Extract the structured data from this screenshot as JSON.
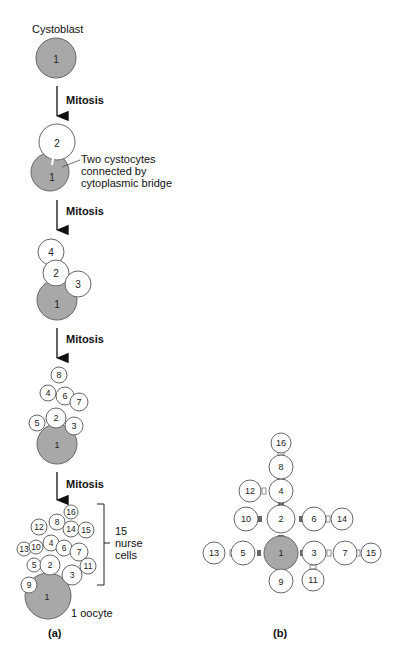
{
  "colors": {
    "oocyte_fill": "#a8a8a8",
    "nurse_fill": "#ffffff",
    "stroke": "#555555",
    "ring_canal_b": "#666666",
    "ring_canal_b_light": "#ffffff",
    "arrow": "#111111"
  },
  "panel_a": {
    "label": "(a)",
    "stage1": {
      "title": "Cystoblast",
      "cells": [
        "1"
      ]
    },
    "arrow1": {
      "label": "Mitosis"
    },
    "stage2": {
      "cells": [
        "1",
        "2"
      ],
      "annotation_line1": "Two cystocytes",
      "annotation_line2": "connected by",
      "annotation_line3": "cytoplasmic bridge"
    },
    "arrow2": {
      "label": "Mitosis"
    },
    "stage3": {
      "cells": [
        "1",
        "2",
        "3",
        "4"
      ]
    },
    "arrow3": {
      "label": "Mitosis"
    },
    "stage4": {
      "cells": [
        "1",
        "2",
        "3",
        "4",
        "5",
        "6",
        "7",
        "8"
      ]
    },
    "arrow4": {
      "label": "Mitosis"
    },
    "stage5": {
      "cells": [
        "1",
        "2",
        "3",
        "4",
        "5",
        "6",
        "7",
        "8",
        "9",
        "10",
        "11",
        "12",
        "13",
        "14",
        "15",
        "16"
      ],
      "bracket_line1": "15",
      "bracket_line2": "nurse",
      "bracket_line3": "cells",
      "oocyte_label": "1 oocyte"
    }
  },
  "panel_b": {
    "label": "(b)",
    "cells": [
      "1",
      "2",
      "3",
      "4",
      "5",
      "6",
      "7",
      "8",
      "9",
      "10",
      "11",
      "12",
      "13",
      "14",
      "15",
      "16"
    ]
  }
}
